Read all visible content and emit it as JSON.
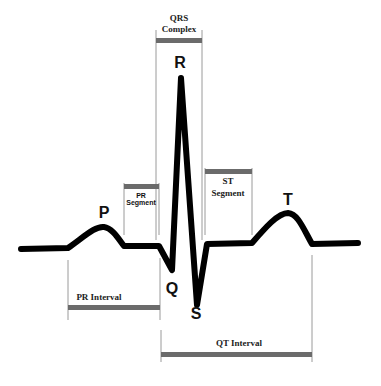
{
  "diagram": {
    "waves": {
      "p": "P",
      "q": "Q",
      "r": "R",
      "s": "S",
      "t": "T"
    },
    "segments": {
      "qrs_line1": "QRS",
      "qrs_line2": "Complex",
      "pr_seg_line1": "PR",
      "pr_seg_line2": "Segment",
      "st_seg_line1": "ST",
      "st_seg_line2": "Segment",
      "pr_interval": "PR Interval",
      "qt_interval": "QT Interval"
    },
    "colors": {
      "trace": "#000000",
      "bar": "#6b6b6b",
      "guide": "#999999"
    }
  }
}
